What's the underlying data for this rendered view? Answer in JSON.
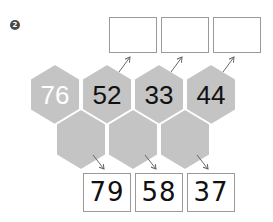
{
  "problem_number": "2",
  "top_row_hexagons": [
    {
      "value": "76",
      "style": "light"
    },
    {
      "value": "52",
      "style": "dark"
    },
    {
      "value": "33",
      "style": "dark"
    },
    {
      "value": "44",
      "style": "dark"
    }
  ],
  "bottom_row_hexagons": [
    {
      "value": ""
    },
    {
      "value": ""
    },
    {
      "value": ""
    }
  ],
  "top_answer_boxes": [
    {
      "value": ""
    },
    {
      "value": ""
    },
    {
      "value": ""
    }
  ],
  "bottom_answer_boxes": [
    {
      "value": "79"
    },
    {
      "value": "58"
    },
    {
      "value": "37"
    }
  ],
  "colors": {
    "hexagon_fill": "#c4c4c4",
    "box_border": "#9a9a9a",
    "arrow": "#666666"
  }
}
